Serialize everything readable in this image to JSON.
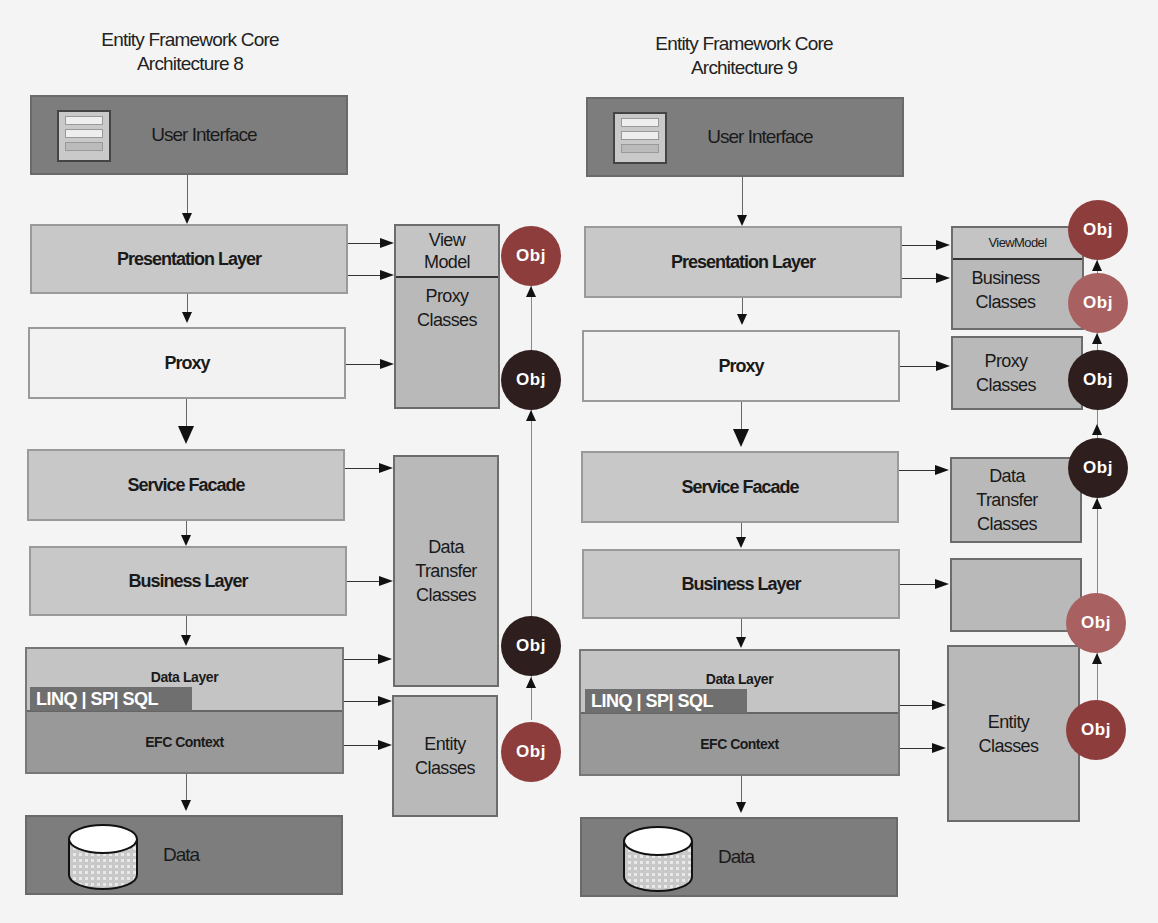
{
  "left": {
    "title_line1": "Entity Framework Core",
    "title_line2": "Architecture 8",
    "layers": {
      "ui": "User Interface",
      "presentation": "Presentation Layer",
      "proxy": "Proxy",
      "service": "Service Facade",
      "business": "Business Layer",
      "data_layer": "Data Layer",
      "linq": "LINQ | SP| SQL",
      "efc": "EFC Context",
      "data": "Data"
    },
    "panels": {
      "view_model": "View\nModel",
      "proxy_classes": "Proxy\nClasses",
      "dto": "Data\nTransfer\nClasses",
      "entity": "Entity\nClasses"
    },
    "obj_label": "Obj"
  },
  "right": {
    "title_line1": "Entity Framework Core",
    "title_line2": "Architecture 9",
    "layers": {
      "ui": "User Interface",
      "presentation": "Presentation Layer",
      "proxy": "Proxy",
      "service": "Service Facade",
      "business": "Business Layer",
      "data_layer": "Data Layer",
      "linq": "LINQ | SP| SQL",
      "efc": "EFC Context",
      "data": "Data"
    },
    "panels": {
      "view_model": "ViewModel",
      "business_classes_top": "Business\nClasses",
      "proxy_classes": "Proxy\nClasses",
      "dto": "Data\nTransfer\nClasses",
      "business_classes": "Business\nClasses",
      "entity": "Entity\nClasses"
    },
    "obj_label": "Obj"
  },
  "colors": {
    "dark_layer": "#7d7d7d",
    "gray_layer": "#c8c8c8",
    "panel": "#b9b9b9",
    "obj_red": "#8e3d3d",
    "obj_pink": "#a86060",
    "obj_black": "#2e1e1e"
  }
}
